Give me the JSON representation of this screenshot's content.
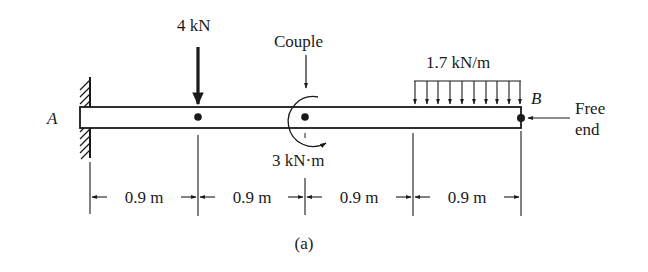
{
  "diagram": {
    "type": "cantilever-beam-loading",
    "caption": "(a)",
    "support": {
      "label": "A",
      "type": "fixed-wall"
    },
    "free_end": {
      "label": "B",
      "note_line1": "Free",
      "note_line2": "end"
    },
    "loads": {
      "point_load": {
        "label": "4 kN",
        "position_m": 0.9
      },
      "couple": {
        "title": "Couple",
        "label": "3 kN·m",
        "position_m": 1.8,
        "direction": "clockwise"
      },
      "distributed": {
        "label": "1.7 kN/m",
        "from_m": 2.7,
        "to_m": 3.6,
        "arrow_count": 10
      }
    },
    "dimensions": [
      {
        "label": "0.9 m"
      },
      {
        "label": "0.9 m"
      },
      {
        "label": "0.9 m"
      },
      {
        "label": "0.9 m"
      }
    ],
    "colors": {
      "ink": "#1a1a1a",
      "background": "#ffffff"
    }
  }
}
